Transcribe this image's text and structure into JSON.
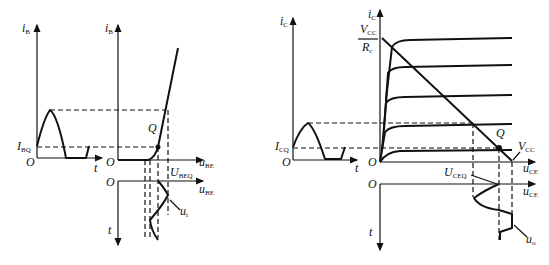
{
  "left_figure": {
    "input_wave_axis": {
      "y_label": "i",
      "y_sub": "B",
      "x_label": "t",
      "origin": "O",
      "tick_label": "I",
      "tick_sub": "BQ"
    },
    "input_char_axis": {
      "y_label": "i",
      "y_sub": "B",
      "x_label": "u",
      "x_sub": "BE",
      "origin": "O",
      "q_label": "Q",
      "ubeq_label": "U",
      "ubeq_sub": "BEQ"
    },
    "ui_axis": {
      "x_label": "u",
      "x_sub": "BE",
      "t_label": "t",
      "origin": "O",
      "wave_label": "u",
      "wave_sub": "i"
    }
  },
  "right_figure": {
    "ic_wave_axis": {
      "y_label": "i",
      "y_sub": "C",
      "x_label": "t",
      "origin": "O",
      "tick_label": "I",
      "tick_sub": "CQ"
    },
    "output_char_axis": {
      "y_label": "i",
      "y_sub": "C",
      "x_label": "u",
      "x_sub": "CE",
      "origin": "O",
      "q_label": "Q",
      "vcc_label": "V",
      "vcc_sub": "CC",
      "frac_num": "V",
      "frac_num_sub": "CC",
      "frac_den": "R",
      "frac_den_sub": "c"
    },
    "uo_axis": {
      "x_label": "u",
      "x_sub": "CE",
      "t_label": "t",
      "origin": "O",
      "uceq_label": "U",
      "uceq_sub": "CEQ",
      "wave_label": "u",
      "wave_sub": "o"
    }
  }
}
